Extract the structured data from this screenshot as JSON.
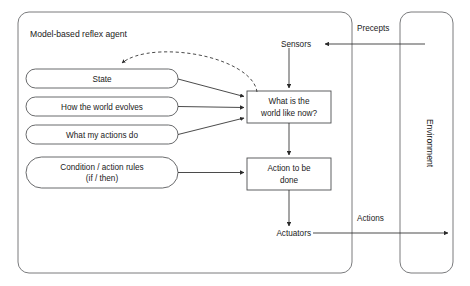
{
  "diagram": {
    "title": "Model-based reflex agent",
    "agent_box_label": "Model-based reflex agent",
    "environment_label": "Environment",
    "knowledge_nodes": [
      {
        "label": "State"
      },
      {
        "label": "How the world evolves"
      },
      {
        "label": "What my actions do"
      }
    ],
    "rules_node": {
      "line1": "Condition / action rules",
      "line2": "(if / then)"
    },
    "process_nodes": [
      {
        "line1": "What is the",
        "line2": "world like now?"
      },
      {
        "line1": "Action to be",
        "line2": "done"
      }
    ],
    "io_labels": {
      "sensors": "Sensors",
      "actuators": "Actuators",
      "percepts": "Precepts",
      "actions": "Actions"
    },
    "colors": {
      "background": "#ffffff",
      "stroke": "#58595b",
      "box_stroke": "#4d4e50",
      "connector": "#2b2b2b",
      "text": "#1a1a1a"
    }
  }
}
